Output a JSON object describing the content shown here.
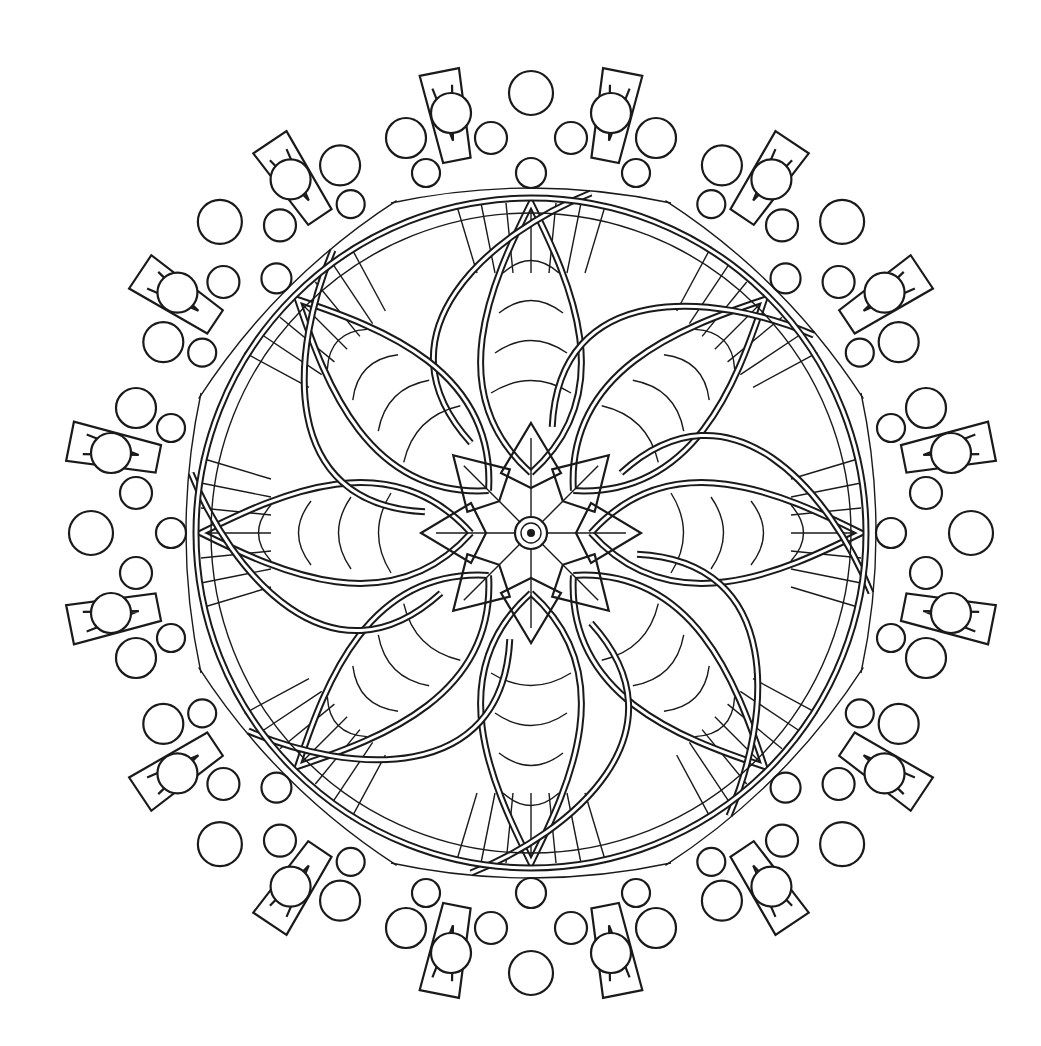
{
  "artwork": {
    "type": "mandala-line-art",
    "symmetry": 8,
    "center": [
      531,
      533
    ],
    "outer_radius": 465,
    "colors": {
      "line": "#1a1a1a",
      "background": "#ffffff"
    }
  }
}
